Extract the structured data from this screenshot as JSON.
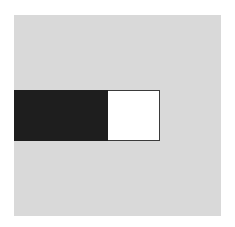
{
  "diagram": {
    "background_color": "#ffffff",
    "field": {
      "shape": "square",
      "color": "#d9d9d9"
    },
    "bar": {
      "filled_segment": {
        "shape": "rectangle",
        "color": "#1e1e1e"
      },
      "empty_segment": {
        "shape": "rectangle",
        "color": "#ffffff",
        "border_color": "#3a3a3a"
      }
    }
  }
}
